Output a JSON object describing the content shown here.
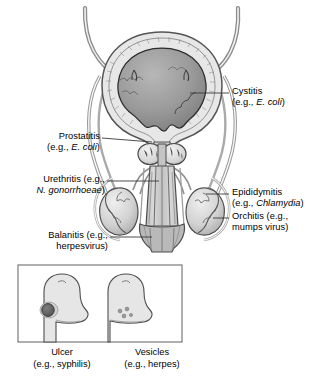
{
  "figure": {
    "background_color": "#ffffff",
    "line_color": "#3a3a3a",
    "fill_light": "#e3e3e3",
    "fill_mid": "#c9c9c9",
    "fill_dark": "#8d8d8d",
    "fill_darkest": "#6b6b6b"
  },
  "callouts": [
    {
      "id": "cystitis",
      "side": "right",
      "line1": "Cystitis",
      "line2_prefix": "(e.g., ",
      "line2_species": "E. coli",
      "line2_suffix": ")",
      "target": "bladder"
    },
    {
      "id": "prostatitis",
      "side": "left",
      "line1": "Prostatitis",
      "line2_prefix": "(e.g., ",
      "line2_species": "E. coli",
      "line2_suffix": ")",
      "target": "prostate"
    },
    {
      "id": "urethritis",
      "side": "left",
      "line1": "Urethritis (e.g.,",
      "line2_prefix": "",
      "line2_species": "N. gonorrhoeae",
      "line2_suffix": ")",
      "target": "urethra"
    },
    {
      "id": "balanitis",
      "side": "left",
      "line1": "Balanitis (e.g.,",
      "line2_prefix": "",
      "line2_species": "",
      "line2_suffix": "herpesvirus)",
      "target": "glans"
    },
    {
      "id": "epididymitis",
      "side": "right",
      "line1": "Epididymitis",
      "line2_prefix": "(e.g., ",
      "line2_species": "Chlamydia",
      "line2_suffix": ")",
      "target": "epididymis"
    },
    {
      "id": "orchitis",
      "side": "right",
      "line1": "Orchitis (e.g.,",
      "line2_prefix": "",
      "line2_species": "",
      "line2_suffix": "mumps virus)",
      "target": "testis"
    }
  ],
  "inset": {
    "panels": [
      {
        "id": "ulcer",
        "caption_line1": "Ulcer",
        "caption_line2": "(e.g., syphilis)",
        "lesion": "single dark ulcer on glans"
      },
      {
        "id": "vesicles",
        "caption_line1": "Vesicles",
        "caption_line2": "(e.g., herpes)",
        "lesion": "cluster of small vesicles on shaft"
      }
    ]
  }
}
